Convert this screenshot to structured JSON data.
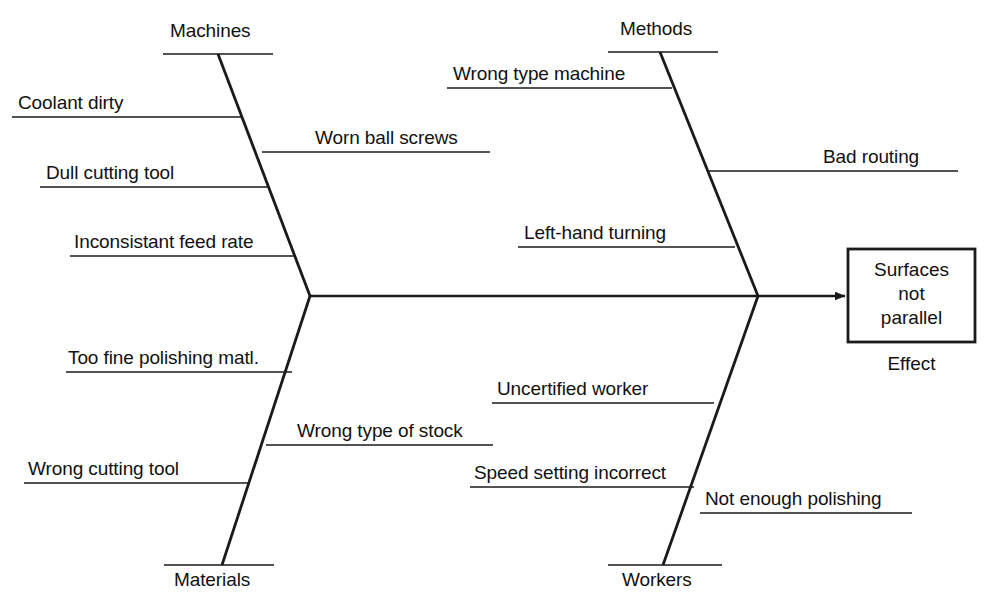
{
  "diagram": {
    "type": "fishbone-cause-and-effect",
    "effect": {
      "box_text_lines": [
        "Surfaces",
        "not",
        "parallel"
      ],
      "box_text": "Surfaces not parallel",
      "caption": "Effect"
    },
    "categories": [
      {
        "name": "Machines",
        "position": "upper-left",
        "causes": [
          "Coolant dirty",
          "Worn ball screws",
          "Dull cutting tool",
          "Inconsistant feed rate"
        ]
      },
      {
        "name": "Methods",
        "position": "upper-right",
        "causes": [
          "Wrong type machine",
          "Bad routing",
          "Left-hand turning"
        ]
      },
      {
        "name": "Materials",
        "position": "lower-left",
        "causes": [
          "Too fine polishing matl.",
          "Wrong type of stock",
          "Wrong cutting tool"
        ]
      },
      {
        "name": "Workers",
        "position": "lower-right",
        "causes": [
          "Uncertified worker",
          "Speed setting incorrect",
          "Not enough polishing"
        ]
      }
    ]
  },
  "labels": {
    "machines": "Machines",
    "methods": "Methods",
    "materials": "Materials",
    "workers": "Workers",
    "coolant_dirty": "Coolant dirty",
    "worn_ball_screws": "Worn ball screws",
    "dull_cutting_tool": "Dull cutting tool",
    "inconsistant_feed_rate": "Inconsistant feed rate",
    "wrong_type_machine": "Wrong type machine",
    "bad_routing": "Bad routing",
    "left_hand_turning": "Left-hand turning",
    "too_fine_polishing_matl": "Too fine polishing matl.",
    "wrong_type_of_stock": "Wrong type of stock",
    "wrong_cutting_tool": "Wrong cutting tool",
    "uncertified_worker": "Uncertified worker",
    "speed_setting_incorrect": "Speed setting incorrect",
    "not_enough_polishing": "Not enough polishing",
    "effect_line1": "Surfaces",
    "effect_line2": "not",
    "effect_line3": "parallel",
    "effect_caption": "Effect"
  },
  "colors": {
    "background": "#ffffff",
    "line": "#1a1a1a",
    "text": "#111111"
  }
}
